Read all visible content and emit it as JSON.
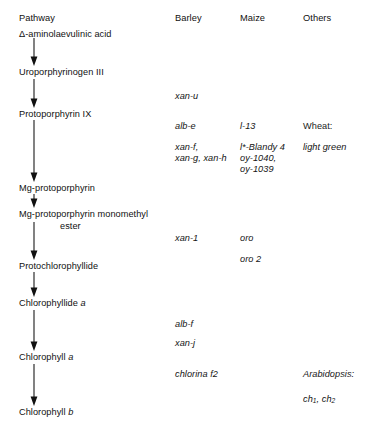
{
  "figure": {
    "type": "pathway-diagram"
  },
  "columns": {
    "pathway": "Pathway",
    "barley": "Barley",
    "maize": "Maize",
    "others": "Others"
  },
  "pathway_steps": [
    {
      "id": "ala",
      "label": "Δ-aminolaevulinic acid"
    },
    {
      "id": "uro",
      "label": "Uroporphyrinogen III"
    },
    {
      "id": "proto9",
      "label": "Protoporphyrin IX"
    },
    {
      "id": "mgproto",
      "label": "Mg-protoporphyrin"
    },
    {
      "id": "mgmme_line1",
      "label": "Mg-protoporphyrin monomethyl"
    },
    {
      "id": "mgmme_line2",
      "label": "ester"
    },
    {
      "id": "pchlide",
      "label": "Protochlorophyllide"
    },
    {
      "id": "chlide_a",
      "label": "Chlorophyllide",
      "italic_suffix": "a"
    },
    {
      "id": "chl_a",
      "label": "Chlorophyll",
      "italic_suffix": "a"
    },
    {
      "id": "chl_b",
      "label": "Chlorophyll",
      "italic_suffix": "b"
    }
  ],
  "mutants": {
    "barley": {
      "after_uro": "xan-u",
      "after_proto9_1": "alb-e",
      "after_proto9_2": "xan-f,",
      "after_proto9_3": "xan-g, xan-h",
      "after_mgmme": "xan-1",
      "after_chlide_1": "alb-f",
      "after_chlide_2": "xan-j",
      "after_chl_a": "chlorina f2"
    },
    "maize": {
      "after_proto9_1": "l-13",
      "after_proto9_2": "l*-Blandy 4",
      "after_proto9_3": "oy-1040,",
      "after_proto9_4": "oy-1039",
      "after_mgmme_1": "oro",
      "after_mgmme_2": "oro 2"
    },
    "others": {
      "wheat_label": "Wheat:",
      "wheat_mutant": "light green",
      "arabidopsis_label": "Arabidopsis:",
      "arabidopsis_mutant_ch": "ch",
      "arabidopsis_mutant_sub1": "1",
      "arabidopsis_mutant_sep": ", ",
      "arabidopsis_mutant_ch2": "ch",
      "arabidopsis_mutant_sub2": "2"
    }
  },
  "colors": {
    "text": "#111111",
    "arrow": "#111111",
    "background": "#ffffff"
  }
}
